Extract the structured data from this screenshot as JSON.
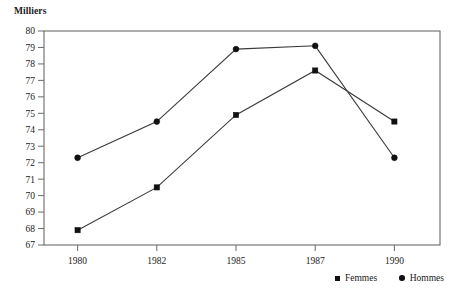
{
  "chart_data": {
    "type": "line",
    "title": "",
    "axis_unit_label": "Milliers",
    "xlabel": "",
    "ylabel": "Milliers",
    "categories": [
      "1980",
      "1982",
      "1985",
      "1987",
      "1990"
    ],
    "ylim": [
      67,
      80
    ],
    "ytick_step": 1,
    "yticks": [
      67,
      68,
      69,
      70,
      71,
      72,
      73,
      74,
      75,
      76,
      77,
      78,
      79,
      80
    ],
    "grid": false,
    "legend_position": "bottom-right",
    "series": [
      {
        "name": "Femmes",
        "marker": "square",
        "color": "#111111",
        "values": [
          67.9,
          70.5,
          74.9,
          77.6,
          74.5
        ]
      },
      {
        "name": "Hommes",
        "marker": "circle",
        "color": "#111111",
        "values": [
          72.3,
          74.5,
          78.9,
          79.1,
          72.3
        ]
      }
    ]
  },
  "legend": {
    "entries": [
      {
        "label": "Femmes",
        "marker_name": "square-marker-icon"
      },
      {
        "label": "Hommes",
        "marker_name": "circle-marker-icon"
      }
    ]
  }
}
